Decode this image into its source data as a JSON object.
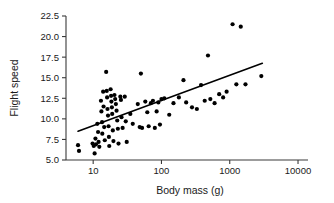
{
  "chart_data": {
    "type": "scatter",
    "title": "",
    "xlabel": "Body mass (g)",
    "ylabel": "Flight speed",
    "xscale": "log",
    "yscale": "linear",
    "xlim": [
      4,
      14000
    ],
    "ylim": [
      5.0,
      22.5
    ],
    "grid": false,
    "legend": null,
    "x_ticks": [
      10,
      100,
      1000,
      10000
    ],
    "x_tick_labels": [
      "10",
      "100",
      "1000",
      "10000"
    ],
    "y_ticks": [
      5.0,
      7.5,
      10.0,
      12.5,
      15.0,
      17.5,
      20.0,
      22.5
    ],
    "y_tick_labels": [
      "5.0",
      "7.5",
      "10.0",
      "12.5",
      "15.0",
      "17.5",
      "20.0",
      "22.5"
    ],
    "marker": "filled-circle",
    "marker_color": "#000000",
    "points": [
      [
        6.0,
        6.8
      ],
      [
        6.2,
        6.1
      ],
      [
        9.8,
        7.0
      ],
      [
        10.2,
        6.7
      ],
      [
        10.5,
        5.8
      ],
      [
        10.8,
        7.6
      ],
      [
        11.0,
        6.9
      ],
      [
        11.5,
        9.4
      ],
      [
        11.8,
        8.4
      ],
      [
        12.0,
        7.2
      ],
      [
        12.3,
        6.6
      ],
      [
        13.0,
        12.2
      ],
      [
        13.2,
        10.9
      ],
      [
        13.5,
        9.6
      ],
      [
        13.6,
        8.2
      ],
      [
        14.0,
        13.3
      ],
      [
        14.2,
        11.5
      ],
      [
        14.5,
        9.0
      ],
      [
        14.8,
        7.4
      ],
      [
        15.5,
        15.7
      ],
      [
        15.8,
        13.4
      ],
      [
        16.0,
        12.6
      ],
      [
        16.2,
        11.2
      ],
      [
        16.5,
        10.4
      ],
      [
        16.8,
        9.1
      ],
      [
        17.0,
        7.8
      ],
      [
        17.2,
        6.7
      ],
      [
        18.0,
        13.6
      ],
      [
        18.3,
        12.8
      ],
      [
        18.5,
        12.1
      ],
      [
        18.8,
        11.4
      ],
      [
        19.0,
        10.6
      ],
      [
        19.4,
        8.6
      ],
      [
        19.8,
        7.3
      ],
      [
        20.5,
        12.9
      ],
      [
        21.0,
        12.4
      ],
      [
        21.5,
        11.8
      ],
      [
        22.0,
        11.0
      ],
      [
        22.5,
        9.8
      ],
      [
        23.0,
        8.8
      ],
      [
        23.5,
        7.0
      ],
      [
        25.0,
        12.7
      ],
      [
        25.5,
        12.3
      ],
      [
        26.0,
        10.2
      ],
      [
        27.0,
        8.9
      ],
      [
        29.0,
        12.7
      ],
      [
        30.0,
        9.7
      ],
      [
        31.0,
        7.2
      ],
      [
        35.0,
        10.6
      ],
      [
        38.0,
        9.4
      ],
      [
        45.0,
        11.8
      ],
      [
        48.0,
        9.0
      ],
      [
        50.0,
        15.5
      ],
      [
        52.0,
        8.9
      ],
      [
        58.0,
        12.1
      ],
      [
        62.0,
        10.8
      ],
      [
        65.0,
        9.1
      ],
      [
        70.0,
        11.9
      ],
      [
        75.0,
        12.2
      ],
      [
        80.0,
        8.9
      ],
      [
        85.0,
        10.9
      ],
      [
        90.0,
        12.0
      ],
      [
        95.0,
        9.3
      ],
      [
        100.0,
        12.4
      ],
      [
        110.0,
        12.5
      ],
      [
        130.0,
        10.5
      ],
      [
        150.0,
        11.9
      ],
      [
        180.0,
        12.6
      ],
      [
        210.0,
        14.7
      ],
      [
        230.0,
        12.0
      ],
      [
        280.0,
        11.4
      ],
      [
        330.0,
        11.2
      ],
      [
        380.0,
        14.1
      ],
      [
        430.0,
        12.2
      ],
      [
        480.0,
        17.7
      ],
      [
        520.0,
        12.4
      ],
      [
        600.0,
        11.9
      ],
      [
        700.0,
        13.0
      ],
      [
        800.0,
        12.6
      ],
      [
        900.0,
        13.3
      ],
      [
        1100.0,
        21.5
      ],
      [
        1250.0,
        14.2
      ],
      [
        1450.0,
        21.2
      ],
      [
        1700.0,
        14.2
      ],
      [
        2900.0,
        15.2
      ]
    ],
    "fit_line": {
      "x_start": 6.0,
      "y_start": 8.5,
      "x_end": 3000.0,
      "y_end": 16.75
    }
  }
}
